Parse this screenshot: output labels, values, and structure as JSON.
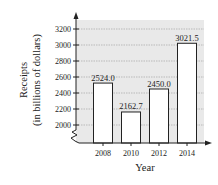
{
  "chart_data": {
    "type": "bar",
    "title": "",
    "xlabel": "Year",
    "ylabel": "Receipts",
    "ylabel_sub": "(in billions of dollars)",
    "categories": [
      "2008",
      "2010",
      "2012",
      "2014"
    ],
    "values": [
      2524.0,
      2162.7,
      2450.0,
      3021.5
    ],
    "data_labels": [
      "2524.0",
      "2162.7",
      "2450.0",
      "3021.5"
    ],
    "yticks": [
      2000,
      2200,
      2400,
      2600,
      2800,
      3000,
      3200
    ],
    "ytick_labels": [
      "2000",
      "2200",
      "2400",
      "2600",
      "2800",
      "3000",
      "3200"
    ],
    "ylim": [
      1850,
      3300
    ],
    "axis_break": true,
    "grid": true,
    "legend": "none",
    "colors": {
      "plot_background": "#e9e9e9",
      "gridline": "#9a9a9a",
      "bar_fill": "#ffffff",
      "bar_stroke": "#222222",
      "axis": "#222222"
    }
  }
}
